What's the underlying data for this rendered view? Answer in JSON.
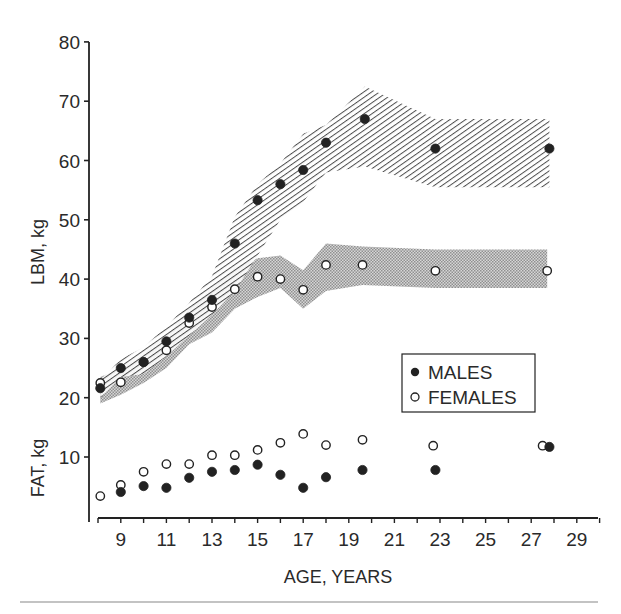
{
  "chart_data": {
    "type": "scatter",
    "title": "",
    "xlabel": "AGE, YEARS",
    "ylabel_upper": "LBM, kg",
    "ylabel_lower": "FAT, kg",
    "xlim": [
      8,
      30
    ],
    "ylim": [
      0,
      80
    ],
    "x_ticks": [
      9,
      11,
      13,
      15,
      17,
      19,
      21,
      23,
      25,
      27,
      29
    ],
    "y_ticks": [
      10,
      20,
      30,
      40,
      50,
      60,
      70,
      80
    ],
    "grid": false,
    "legend_position": "right-middle",
    "legend": [
      {
        "label": "MALES",
        "marker": "filled-circle"
      },
      {
        "label": "FEMALES",
        "marker": "open-circle"
      }
    ],
    "series": [
      {
        "name": "MALES LBM",
        "marker": "filled-circle",
        "x": [
          8.1,
          9,
          10,
          11,
          12,
          13,
          14,
          15,
          16,
          17,
          18,
          19.7,
          22.8,
          27.8
        ],
        "y": [
          21.6,
          25,
          26,
          29.5,
          33.5,
          36.5,
          46,
          53.3,
          56,
          58.4,
          63,
          67,
          62,
          62
        ]
      },
      {
        "name": "FEMALES LBM",
        "marker": "open-circle",
        "x": [
          8.1,
          9,
          10,
          11,
          12,
          13,
          14,
          15,
          16,
          17,
          18,
          19.6,
          22.8,
          27.7
        ],
        "y": [
          22.5,
          22.6,
          26,
          28,
          32.6,
          35.3,
          38.3,
          40.4,
          40,
          38.2,
          42.4,
          42.4,
          41.4,
          41.4
        ]
      },
      {
        "name": "MALES FAT",
        "marker": "filled-circle",
        "x": [
          9,
          10,
          11,
          12,
          13,
          14,
          15,
          16,
          17,
          18,
          19.6,
          22.8,
          27.8
        ],
        "y": [
          4.1,
          5.1,
          4.8,
          6.5,
          7.5,
          7.8,
          8.7,
          7,
          4.8,
          6.6,
          7.8,
          7.8,
          11.7
        ]
      },
      {
        "name": "FEMALES FAT",
        "marker": "open-circle",
        "x": [
          8.1,
          9,
          10,
          11,
          12,
          13,
          14,
          15,
          16,
          17,
          18,
          19.6,
          22.7,
          27.5
        ],
        "y": [
          3.4,
          5.3,
          7.5,
          8.8,
          8.8,
          10.3,
          10.3,
          11.2,
          12.4,
          13.9,
          12,
          12.9,
          11.9,
          11.9
        ]
      }
    ],
    "bands": [
      {
        "name": "MALES LBM range",
        "fill": "diagonal-hatch",
        "x": [
          8.1,
          9,
          10,
          11,
          12,
          13,
          14,
          15,
          16,
          17,
          18,
          19.7,
          22.8,
          27.8
        ],
        "upper": [
          23,
          26.5,
          28.5,
          32,
          36,
          40.5,
          50.5,
          56,
          59.5,
          64.5,
          66,
          72.5,
          67,
          67
        ],
        "lower": [
          20,
          23.5,
          24,
          27,
          30.5,
          34,
          38,
          44,
          50,
          53,
          58,
          59,
          55.5,
          55.5
        ]
      },
      {
        "name": "FEMALES LBM range",
        "fill": "stipple",
        "x": [
          8.1,
          9,
          10,
          11,
          12,
          13,
          14,
          15,
          16,
          17,
          18,
          19.6,
          22.8,
          27.7
        ],
        "upper": [
          23.5,
          25,
          27.5,
          30.5,
          35,
          38.5,
          42,
          43.5,
          44,
          41.5,
          46,
          45.5,
          45,
          45
        ],
        "lower": [
          19,
          20.5,
          22.5,
          25,
          29,
          31,
          35,
          37,
          38.5,
          35,
          38,
          39,
          38.5,
          38.5
        ]
      }
    ]
  },
  "labels": {
    "xlabel": "AGE, YEARS",
    "ylabel_upper": "LBM, kg",
    "ylabel_lower": "FAT, kg",
    "legend_males": "MALES",
    "legend_females": "FEMALES"
  },
  "colors": {
    "ink": "#222222",
    "background": "#ffffff",
    "stipple": "#9a9a9a",
    "hatch": "#3a3a3a"
  }
}
